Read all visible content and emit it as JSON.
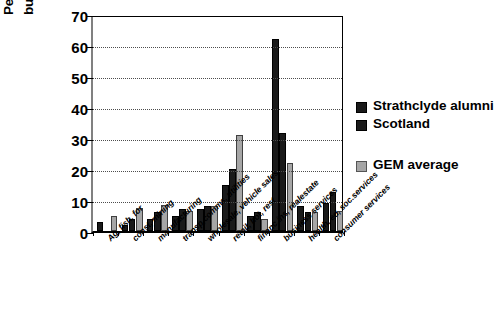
{
  "chart_data": {
    "type": "bar",
    "title": "",
    "xlabel": "",
    "ylabel": "Percentage of all new businesses",
    "ylabel_line1": "Percentage of all new",
    "ylabel_line2": "businesses",
    "ylim": [
      0,
      70
    ],
    "yticks": [
      0,
      10,
      20,
      30,
      40,
      50,
      60,
      70
    ],
    "grid": "horizontal-dotted",
    "legend_position": "right",
    "categories": [
      "Ag, fish, for",
      "const, mining",
      "manufacturing",
      "transp,comms, utilities",
      "wholesale, vehicle sales",
      "retail, hot, rest",
      "financ,ins, realestate",
      "business services",
      "health, ed, soc.services",
      "consumer services"
    ],
    "series": [
      {
        "name": "Strathclyde alumni",
        "color": "#1a1a1a",
        "values": [
          3,
          2,
          4,
          5,
          7,
          15,
          5,
          62,
          8,
          9
        ]
      },
      {
        "name": "Scotland",
        "color": "#1a1a1a",
        "values": [
          0,
          4,
          6,
          7,
          8,
          20,
          6,
          31.5,
          6,
          12.5
        ]
      },
      {
        "name": "GEM average",
        "color": "#a6a6a6",
        "values": [
          5,
          7.5,
          8.5,
          6.5,
          8,
          31,
          4,
          22,
          6,
          6.5
        ]
      }
    ]
  },
  "legend": {
    "items": [
      {
        "label": "Strathclyde alumni",
        "swatch": "dark"
      },
      {
        "label": "Scotland",
        "swatch": "dark"
      },
      {
        "label": "GEM average",
        "swatch": "light"
      }
    ]
  }
}
